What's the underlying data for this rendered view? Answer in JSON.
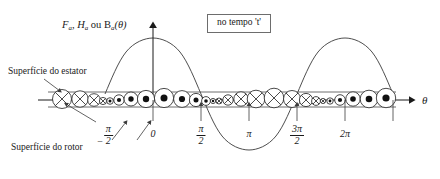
{
  "figure": {
    "ordinate_label_main": "F",
    "ordinate_label_sub1": "a",
    "ordinate_label_mid": ", H",
    "ordinate_label_sub2": "a",
    "ordinate_label_ou": " ou  B",
    "ordinate_label_sub3": "a",
    "ordinate_label_arg": "(θ)",
    "ordinate_label_full": "Fₐ, Hₐ ou Bₐ(θ)",
    "axis_label_x": "θ",
    "time_note": "no tempo 't'",
    "stator_callout": "Superfície do estator",
    "rotor_callout": "Superfície do rotor"
  },
  "ticks": [
    {
      "id": "neg-half-pi",
      "label": "−π/2",
      "numerator": "π",
      "denominator": "2",
      "negative": true,
      "x": 105,
      "fraction": true
    },
    {
      "id": "zero",
      "label": "0",
      "numerator": "0",
      "denominator": "",
      "negative": false,
      "x": 153,
      "fraction": false
    },
    {
      "id": "half-pi",
      "label": "π/2",
      "numerator": "π",
      "denominator": "2",
      "negative": false,
      "x": 201,
      "fraction": true
    },
    {
      "id": "pi",
      "label": "π",
      "numerator": "π",
      "denominator": "",
      "negative": false,
      "x": 249,
      "fraction": false
    },
    {
      "id": "three-half-pi",
      "label": "3π/2",
      "numerator": "3π",
      "denominator": "2",
      "negative": false,
      "x": 297,
      "fraction": true
    },
    {
      "id": "two-pi",
      "label": "2π",
      "numerator": "2π",
      "denominator": "",
      "negative": false,
      "x": 345,
      "fraction": false
    }
  ],
  "chart_data": {
    "type": "line",
    "xlabel": "θ",
    "ylabel": "Fₐ, Hₐ ou Bₐ(θ)",
    "annotation": "no tempo 't'",
    "grid": false,
    "legend": "none",
    "xlim": [
      -1.5708,
      7.33
    ],
    "ylim": [
      -1.05,
      1.05
    ],
    "xtick_values": [
      -1.5708,
      0,
      1.5708,
      3.1416,
      4.7124,
      6.2832
    ],
    "xtick_labels": [
      "−π/2",
      "0",
      "π/2",
      "π",
      "3π/2",
      "2π"
    ],
    "series": [
      {
        "name": "Fₐ(θ) = Fₐ cos θ",
        "function": "cosine",
        "amplitude": 1.0,
        "period": 6.2832,
        "phase": 0,
        "x": [
          -1.5708,
          -1.1781,
          -0.7854,
          -0.3927,
          0,
          0.3927,
          0.7854,
          1.1781,
          1.5708,
          1.9635,
          2.3562,
          2.7489,
          3.1416,
          3.5343,
          3.927,
          4.3197,
          4.7124,
          5.1051,
          5.4978,
          5.8905,
          6.2832,
          6.6759,
          7.0686,
          7.33
        ],
        "y": [
          0,
          0.3827,
          0.7071,
          0.9239,
          1.0,
          0.9239,
          0.7071,
          0.3827,
          0,
          -0.3827,
          -0.7071,
          -0.9239,
          -1.0,
          -0.9239,
          -0.7071,
          -0.3827,
          0,
          0.3827,
          0.7071,
          0.9239,
          1.0,
          0.9239,
          0.7071,
          0.5446
        ]
      }
    ]
  },
  "conductors": {
    "description": "Distributed winding conductors on stator surface",
    "symbol_cross": "current into page",
    "symbol_dot": "current out of page",
    "groups": [
      {
        "symbol": "cross",
        "count": 4,
        "start_x": 58,
        "trend": "decreasing"
      },
      {
        "symbol": "dot",
        "count": 9,
        "start_x": 106,
        "trend": "increasing-then-decreasing"
      },
      {
        "symbol": "cross",
        "count": 9,
        "start_x": 202,
        "trend": "increasing-then-decreasing"
      },
      {
        "symbol": "dot",
        "count": 5,
        "start_x": 298,
        "trend": "increasing"
      }
    ]
  }
}
